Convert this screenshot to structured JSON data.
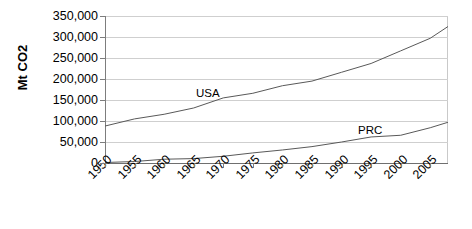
{
  "chart_data": {
    "type": "line",
    "title": "",
    "xlabel": "",
    "ylabel": "Mt CO2",
    "xlim": [
      1950,
      2008
    ],
    "ylim": [
      0,
      350000
    ],
    "grid": true,
    "legend_position": "inline-annotation",
    "x_tick_labels": [
      "1950",
      "1955",
      "1960",
      "1965",
      "1970",
      "1975",
      "1980",
      "1985",
      "1990",
      "1995",
      "2000",
      "2005"
    ],
    "x_ticks": [
      1950,
      1955,
      1960,
      1965,
      1970,
      1975,
      1980,
      1985,
      1990,
      1995,
      2000,
      2005
    ],
    "y_tick_labels": [
      "350,000",
      "300,000",
      "250,000",
      "200,000",
      "150,000",
      "100,000",
      "50,000",
      "0"
    ],
    "y_ticks": [
      350000,
      300000,
      250000,
      200000,
      150000,
      100000,
      50000,
      0
    ],
    "annotations": [
      {
        "text": "USA",
        "x": 1971,
        "y": 182000
      },
      {
        "text": "PRC",
        "x": 1998,
        "y": 78000
      }
    ],
    "series": [
      {
        "name": "USA",
        "color": "#595959",
        "x": [
          1950,
          1955,
          1960,
          1965,
          1970,
          1975,
          1980,
          1985,
          1990,
          1995,
          2000,
          2005,
          2008
        ],
        "values": [
          88000,
          105000,
          116000,
          131000,
          155000,
          166000,
          184000,
          195000,
          216000,
          237000,
          267000,
          297000,
          325000
        ]
      },
      {
        "name": "PRC",
        "color": "#595959",
        "x": [
          1950,
          1955,
          1960,
          1965,
          1970,
          1975,
          1980,
          1985,
          1990,
          1995,
          2000,
          2005,
          2008
        ],
        "values": [
          1200,
          3500,
          9000,
          10500,
          16000,
          24000,
          31000,
          39000,
          50000,
          62000,
          66000,
          84000,
          97000
        ]
      }
    ]
  }
}
